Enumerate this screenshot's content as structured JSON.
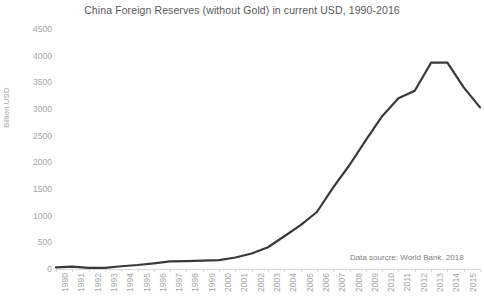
{
  "chart_data": {
    "type": "line",
    "title": "China Foreign Reserves (without Gold) in current USD, 1990-2016",
    "xlabel": "",
    "ylabel": "Billion USD",
    "ylim": [
      0,
      4500
    ],
    "ytick_step": 500,
    "yticks": [
      4500,
      4000,
      3500,
      3000,
      2500,
      2000,
      1500,
      1000,
      500,
      0
    ],
    "grid": false,
    "legend": null,
    "annotation": "Data sourcre: World Bank, 2018",
    "line_color": "#3b3838",
    "categories": [
      "1990",
      "1991",
      "1992",
      "1993",
      "1994",
      "1995",
      "1996",
      "1997",
      "1998",
      "1999",
      "2000",
      "2001",
      "2002",
      "2003",
      "2004",
      "2005",
      "2006",
      "2007",
      "2008",
      "2009",
      "2010",
      "2011",
      "2012",
      "2013",
      "2014",
      "2015",
      "2016"
    ],
    "series": [
      {
        "name": "China Foreign Reserves (without Gold)",
        "values": [
          29,
          43,
          20,
          22,
          52,
          75,
          107,
          142,
          149,
          157,
          168,
          216,
          291,
          408,
          614,
          821,
          1069,
          1530,
          1950,
          2416,
          2866,
          3203,
          3341,
          3868,
          3869,
          3406,
          3030
        ]
      }
    ]
  }
}
